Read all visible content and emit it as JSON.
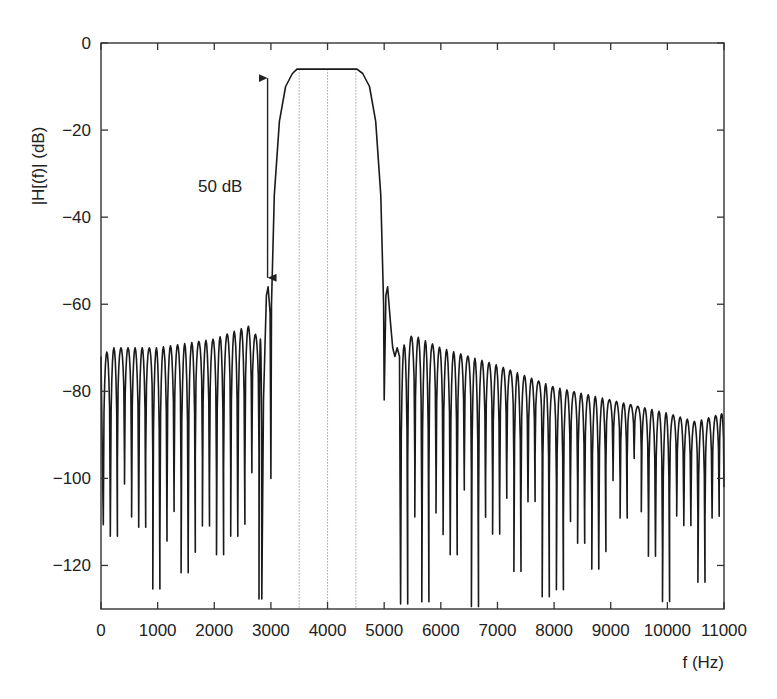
{
  "chart_data": {
    "type": "line",
    "title": "",
    "xlabel": "f (Hz)",
    "ylabel": "|H[(f)| (dB)",
    "xlim": [
      0,
      11000
    ],
    "ylim": [
      -130,
      0
    ],
    "x_ticks": [
      0,
      1000,
      2000,
      3000,
      4000,
      5000,
      6000,
      7000,
      8000,
      9000,
      10000,
      11000
    ],
    "x_tick_labels": [
      "0",
      "1000",
      "2000",
      "3000",
      "4000",
      "5000",
      "6000",
      "7000",
      "8000",
      "9000",
      "10000",
      "11000"
    ],
    "y_ticks": [
      0,
      -20,
      -40,
      -60,
      -80,
      -100,
      -120
    ],
    "y_tick_labels": [
      "0",
      "−20",
      "−40",
      "−60",
      "−80",
      "−100",
      "−120"
    ],
    "grid": false,
    "legend": null,
    "series": [
      {
        "name": "|H(f)|",
        "description": "Bandpass FIR filter magnitude response with sidelobes",
        "passband": {
          "start_hz": 3500,
          "end_hz": 4500,
          "level_db": -6
        },
        "transition_edges_hz": [
          3000,
          5000
        ],
        "first_sidelobes": [
          {
            "f": 2950,
            "db": -56
          },
          {
            "f": 5050,
            "db": -56
          }
        ],
        "sidelobe_envelope": [
          {
            "f": 0,
            "db": -72
          },
          {
            "f": 200,
            "db": -70
          },
          {
            "f": 1000,
            "db": -70
          },
          {
            "f": 2000,
            "db": -68
          },
          {
            "f": 2600,
            "db": -65
          },
          {
            "f": 2800,
            "db": -68
          },
          {
            "f": 5250,
            "db": -71
          },
          {
            "f": 5500,
            "db": -67
          },
          {
            "f": 6000,
            "db": -70
          },
          {
            "f": 7000,
            "db": -74
          },
          {
            "f": 8000,
            "db": -79
          },
          {
            "f": 9000,
            "db": -82
          },
          {
            "f": 10000,
            "db": -85
          },
          {
            "f": 10500,
            "db": -87
          },
          {
            "f": 11000,
            "db": -85
          }
        ],
        "sidelobe_spacing_hz": 125
      }
    ],
    "reference_lines_hz": [
      3500,
      4000,
      4500
    ],
    "annotations": [
      {
        "text": "50 dB",
        "type": "double-arrow",
        "f": 2950,
        "from_db": -6,
        "to_db": -56
      }
    ]
  },
  "labels": {
    "xlabel": "f (Hz)",
    "ylabel": "|H[(f)| (dB)",
    "annotation": "50 dB"
  }
}
